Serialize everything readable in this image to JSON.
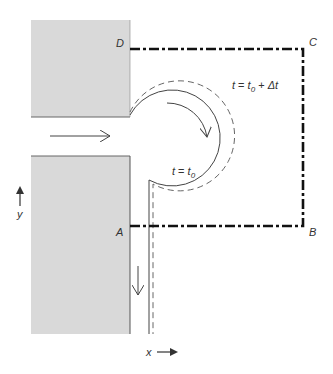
{
  "diagram": {
    "type": "control-volume-fluid-jet",
    "corner_labels": {
      "D": "D",
      "C": "C",
      "B": "B",
      "A": "A"
    },
    "time_labels": {
      "initial": {
        "t": "t",
        "eq": " = ",
        "t0": "t",
        "sub0": "0"
      },
      "later": {
        "t": "t",
        "eq": " = ",
        "t0": "t",
        "sub0": "0",
        "plus": " + ",
        "dt": "Δt"
      }
    },
    "axes": {
      "x": "x",
      "y": "y"
    },
    "colors": {
      "block_fill": "#d9d9d9",
      "block_edge": "#666666",
      "control_volume": "#111111",
      "streamline": "#444444"
    },
    "elements": [
      "upper-wall-block",
      "lower-wall-block",
      "inflow-arrow",
      "outflow-arrow",
      "fluid-boundary-t0",
      "fluid-boundary-t0-plus-dt",
      "rotation-arrow",
      "control-volume-ABCD"
    ]
  }
}
